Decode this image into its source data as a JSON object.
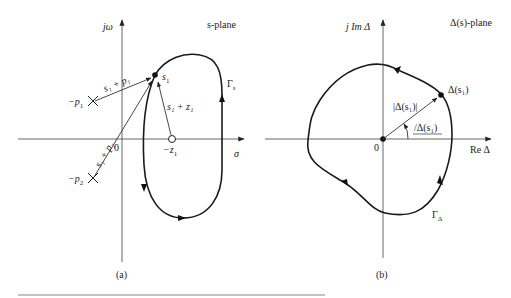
{
  "panel_a": {
    "caption": "(a)",
    "plane_label": "s-plane",
    "y_axis_label": "jω",
    "x_axis_label": "σ",
    "origin_label": "0",
    "contour_label": "Γ",
    "contour_sub": "s",
    "point_s1": "s",
    "point_s1_sub": "1",
    "pole1_label": "−p",
    "pole1_sub": "1",
    "pole2_label": "−p",
    "pole2_sub": "2",
    "zero1_label": "−z",
    "zero1_sub": "1",
    "vec_p1_label": "s₁ + p₁",
    "vec_p2_label": "s₁ + p₂",
    "vec_z1_label": "s₁ + z₁"
  },
  "panel_b": {
    "caption": "(b)",
    "plane_label": "Δ(s)-plane",
    "y_axis_label": "j Im Δ",
    "x_axis_label": "Re Δ",
    "origin_label": "0",
    "contour_label": "Γ",
    "contour_sub": "Δ",
    "point_label": "Δ(s₁)",
    "magnitude_label": "|Δ(s₁)|",
    "angle_label": "/Δ(s₁)"
  },
  "colors": {
    "ink": "#1a1a1a",
    "axis": "#555555",
    "rule": "#888888"
  }
}
